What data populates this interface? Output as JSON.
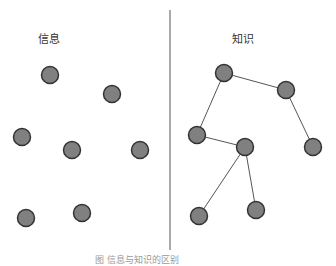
{
  "left_panel": {
    "title": "信息"
  },
  "right_panel": {
    "title": "知识"
  },
  "caption": "图 信息与知识的区别",
  "colors": {
    "node_fill": "#808080",
    "node_stroke": "#333333",
    "edge": "#555555",
    "divider": "#555555"
  },
  "left_nodes": [
    {
      "x": 50,
      "y": 75
    },
    {
      "x": 112,
      "y": 94
    },
    {
      "x": 22,
      "y": 137
    },
    {
      "x": 72,
      "y": 150
    },
    {
      "x": 140,
      "y": 150
    },
    {
      "x": 26,
      "y": 218
    },
    {
      "x": 82,
      "y": 213
    }
  ],
  "right_nodes": [
    {
      "x": 224,
      "y": 73
    },
    {
      "x": 286,
      "y": 90
    },
    {
      "x": 197,
      "y": 135
    },
    {
      "x": 245,
      "y": 147
    },
    {
      "x": 313,
      "y": 147
    },
    {
      "x": 199,
      "y": 216
    },
    {
      "x": 256,
      "y": 210
    }
  ],
  "right_edges": [
    [
      0,
      1
    ],
    [
      0,
      2
    ],
    [
      1,
      4
    ],
    [
      2,
      3
    ],
    [
      3,
      5
    ],
    [
      3,
      6
    ]
  ]
}
